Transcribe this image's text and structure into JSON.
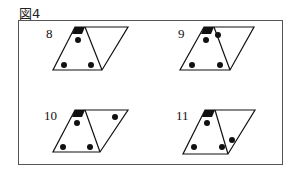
{
  "figure": {
    "title": "図4",
    "panels": [
      {
        "label": "8",
        "label_pos": [
          46,
          38
        ],
        "parallelogram": [
          [
            75,
            27
          ],
          [
            128,
            27
          ],
          [
            102,
            70
          ],
          [
            53,
            70
          ]
        ],
        "inner_line": [
          [
            85,
            27
          ],
          [
            102,
            70
          ]
        ],
        "cap": [
          [
            75,
            27
          ],
          [
            85,
            27
          ],
          [
            82,
            34
          ],
          [
            72,
            34
          ]
        ],
        "dots": [
          [
            78,
            40
          ],
          [
            64,
            65
          ],
          [
            91,
            65
          ]
        ]
      },
      {
        "label": "9",
        "label_pos": [
          178,
          38
        ],
        "parallelogram": [
          [
            204,
            27
          ],
          [
            254,
            27
          ],
          [
            230,
            70
          ],
          [
            180,
            70
          ]
        ],
        "inner_line": [
          [
            214,
            27
          ],
          [
            230,
            70
          ]
        ],
        "cap": [
          [
            204,
            27
          ],
          [
            214,
            27
          ],
          [
            211,
            34
          ],
          [
            201,
            34
          ]
        ],
        "dots": [
          [
            206,
            40
          ],
          [
            218,
            35
          ],
          [
            192,
            65
          ],
          [
            220,
            65
          ]
        ]
      },
      {
        "label": "10",
        "label_pos": [
          44,
          120
        ],
        "parallelogram": [
          [
            75,
            110
          ],
          [
            128,
            110
          ],
          [
            100,
            152
          ],
          [
            53,
            152
          ]
        ],
        "inner_line": [
          [
            85,
            110
          ],
          [
            100,
            152
          ]
        ],
        "cap": [
          [
            75,
            110
          ],
          [
            85,
            110
          ],
          [
            82,
            117
          ],
          [
            72,
            117
          ]
        ],
        "dots": [
          [
            77,
            123
          ],
          [
            115,
            117
          ],
          [
            63,
            147
          ],
          [
            90,
            147
          ]
        ]
      },
      {
        "label": "11",
        "label_pos": [
          176,
          120
        ],
        "parallelogram": [
          [
            205,
            110
          ],
          [
            255,
            110
          ],
          [
            228,
            154
          ],
          [
            183,
            154
          ]
        ],
        "inner_line": [
          [
            215,
            110
          ],
          [
            228,
            154
          ]
        ],
        "cap": [
          [
            205,
            110
          ],
          [
            215,
            110
          ],
          [
            212,
            117
          ],
          [
            202,
            117
          ]
        ],
        "dots": [
          [
            207,
            123
          ],
          [
            232,
            140
          ],
          [
            194,
            147
          ],
          [
            222,
            147
          ]
        ]
      }
    ],
    "colors": {
      "stroke": "#111111",
      "fill": "#111111",
      "frame": "#555555"
    }
  }
}
